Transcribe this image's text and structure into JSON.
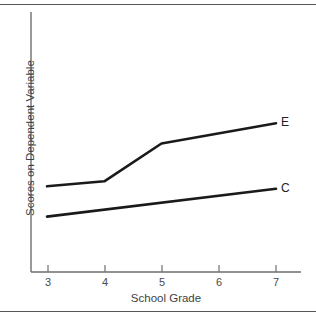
{
  "figure": {
    "background_color": "#ffffff",
    "rule_color": "#555555",
    "line_color": "#1a1a1a",
    "axis_color": "#6e6e6e",
    "text_color": "#3f3f3f"
  },
  "chart_data": {
    "type": "line",
    "title": "",
    "xlabel": "School Grade",
    "ylabel": "Scores on Dependent Variable",
    "x": [
      3,
      4,
      5,
      6,
      7
    ],
    "xticklabels": [
      "3",
      "4",
      "5",
      "6",
      "7"
    ],
    "yticklabels": [],
    "xlim": [
      3,
      7
    ],
    "ylim": [
      0,
      10
    ],
    "grid": false,
    "legend": "inline-end-labels",
    "series": [
      {
        "name": "E",
        "label": "E",
        "x": [
          3,
          4,
          5,
          7
        ],
        "values": [
          3.4,
          3.6,
          5.1,
          5.9
        ],
        "color": "#1a1a1a"
      },
      {
        "name": "C",
        "label": "C",
        "x": [
          3,
          7
        ],
        "values": [
          2.2,
          3.3
        ],
        "color": "#1a1a1a"
      }
    ]
  }
}
